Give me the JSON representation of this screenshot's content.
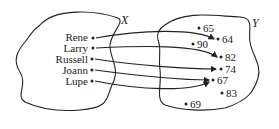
{
  "diagram": {
    "type": "function mapping",
    "domain_set": {
      "name": "X",
      "elements": [
        "Rene",
        "Larry",
        "Russell",
        "Joann",
        "Lupe"
      ]
    },
    "codomain_set": {
      "name": "Y",
      "elements": [
        "65",
        "64",
        "90",
        "82",
        "74",
        "67",
        "83",
        "69"
      ]
    },
    "mappings": [
      {
        "from": "Rene",
        "to": "64"
      },
      {
        "from": "Larry",
        "to": "82"
      },
      {
        "from": "Russell",
        "to": "74"
      },
      {
        "from": "Joann",
        "to": "67"
      },
      {
        "from": "Lupe",
        "to": "67"
      }
    ]
  }
}
